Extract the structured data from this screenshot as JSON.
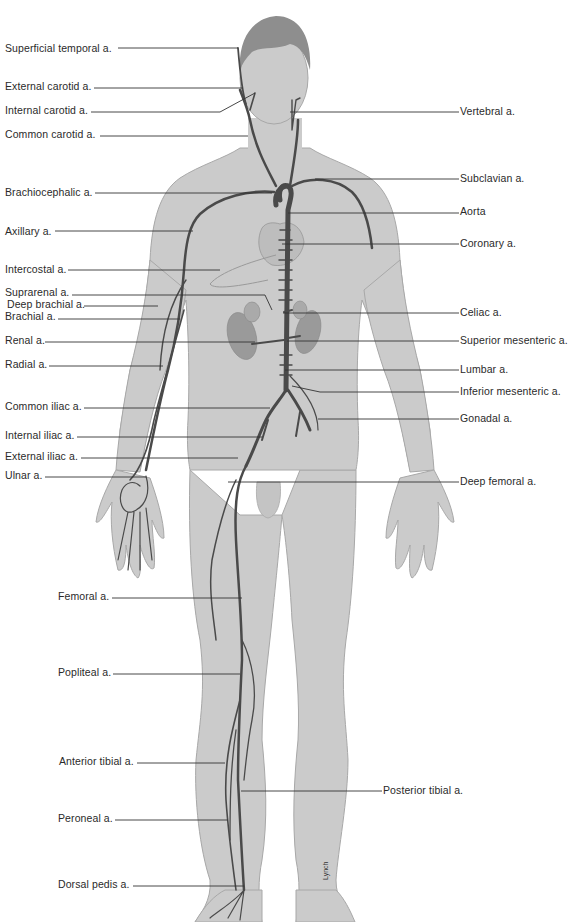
{
  "diagram": {
    "type": "anatomical-illustration",
    "colors": {
      "background": "#ffffff",
      "body_fill": "#cbcbcb",
      "body_outline": "#a8a8a8",
      "hair": "#8e8e8e",
      "artery": "#4a4a4a",
      "organ": "#9a9a9a",
      "label_text": "#2a2a2a",
      "leader_line": "#333333"
    },
    "signature": "Lynch",
    "labels_left": [
      {
        "id": "superficial-temporal",
        "text": "Superficial temporal a.",
        "x": 5,
        "y": 42,
        "line": [
          118,
          48,
          238,
          48
        ]
      },
      {
        "id": "external-carotid",
        "text": "External carotid a.",
        "x": 5,
        "y": 80,
        "line": [
          94,
          88,
          243,
          88
        ]
      },
      {
        "id": "internal-carotid",
        "text": "Internal carotid a.",
        "x": 5,
        "y": 104,
        "line": [
          91,
          112,
          220,
          112,
          255,
          93
        ]
      },
      {
        "id": "common-carotid",
        "text": "Common carotid a.",
        "x": 5,
        "y": 128,
        "line": [
          100,
          136,
          248,
          136
        ]
      },
      {
        "id": "brachiocephalic",
        "text": "Brachiocephalic a.",
        "x": 5,
        "y": 186,
        "line": [
          95,
          193,
          272,
          193
        ]
      },
      {
        "id": "axillary",
        "text": "Axillary a.",
        "x": 5,
        "y": 225,
        "line": [
          55,
          231,
          193,
          231
        ]
      },
      {
        "id": "intercostal",
        "text": "Intercostal a.",
        "x": 5,
        "y": 263,
        "line": [
          68,
          270,
          220,
          270
        ]
      },
      {
        "id": "suprarenal",
        "text": "Suprarenal a.",
        "x": 5,
        "y": 286,
        "line": [
          72,
          295,
          265,
          295,
          272,
          310
        ]
      },
      {
        "id": "deep-brachial",
        "text": "Deep brachial a.",
        "x": 7,
        "y": 298,
        "line": [
          84,
          306,
          158,
          306
        ]
      },
      {
        "id": "brachial",
        "text": "Brachial a.",
        "x": 5,
        "y": 310,
        "line": [
          58,
          319,
          180,
          319
        ]
      },
      {
        "id": "renal",
        "text": "Renal a.",
        "x": 5,
        "y": 334,
        "line": [
          45,
          342,
          255,
          342
        ]
      },
      {
        "id": "radial",
        "text": "Radial a.",
        "x": 5,
        "y": 358,
        "line": [
          49,
          366,
          163,
          366
        ]
      },
      {
        "id": "common-iliac",
        "text": "Common iliac a.",
        "x": 5,
        "y": 398,
        "line": [
          84,
          408,
          270,
          408
        ]
      },
      {
        "id": "internal-iliac",
        "text": "Internal iliac a.",
        "x": 5,
        "y": 427,
        "line": [
          77,
          437,
          262,
          437
        ]
      },
      {
        "id": "external-iliac",
        "text": "External iliac a.",
        "x": 5,
        "y": 448,
        "line": [
          81,
          458,
          238,
          458
        ]
      },
      {
        "id": "ulnar",
        "text": "Ulnar a.",
        "x": 5,
        "y": 469,
        "line": [
          45,
          477,
          146,
          477
        ]
      },
      {
        "id": "femoral",
        "text": "Femoral a.",
        "x": 58,
        "y": 589,
        "line": [
          112,
          598,
          242,
          598
        ]
      },
      {
        "id": "popliteal",
        "text": "Popliteal a.",
        "x": 58,
        "y": 665,
        "line": [
          113,
          674,
          240,
          674
        ]
      },
      {
        "id": "anterior-tibial",
        "text": "Anterior tibial a.",
        "x": 59,
        "y": 754,
        "line": [
          137,
          763,
          225,
          763
        ]
      },
      {
        "id": "peroneal",
        "text": "Peroneal a.",
        "x": 58,
        "y": 811,
        "line": [
          115,
          820,
          228,
          820
        ]
      },
      {
        "id": "dorsal-pedis",
        "text": "Dorsal pedis a.",
        "x": 58,
        "y": 878,
        "line": [
          133,
          886,
          244,
          886
        ]
      }
    ],
    "labels_right": [
      {
        "id": "vertebral",
        "text": "Vertebral a.",
        "x": 460,
        "y": 104,
        "line": [
          290,
          112,
          459,
          112
        ]
      },
      {
        "id": "subclavian",
        "text": "Subclavian a.",
        "x": 460,
        "y": 171,
        "line": [
          315,
          179,
          459,
          179
        ]
      },
      {
        "id": "aorta",
        "text": "Aorta",
        "x": 460,
        "y": 204,
        "line": [
          288,
          213,
          459,
          213
        ]
      },
      {
        "id": "coronary",
        "text": "Coronary a.",
        "x": 460,
        "y": 236,
        "line": [
          282,
          244,
          459,
          244
        ]
      },
      {
        "id": "celiac",
        "text": "Celiac a.",
        "x": 460,
        "y": 305,
        "line": [
          283,
          313,
          459,
          313
        ]
      },
      {
        "id": "superior-mesenteric",
        "text": "Superior mesenteric a.",
        "x": 460,
        "y": 333,
        "line": [
          287,
          341,
          459,
          341
        ]
      },
      {
        "id": "lumbar",
        "text": "Lumbar a.",
        "x": 460,
        "y": 362,
        "line": [
          285,
          370,
          459,
          370
        ]
      },
      {
        "id": "inferior-mesenteric",
        "text": "Inferior mesenteric a.",
        "x": 460,
        "y": 384,
        "line": [
          292,
          386,
          320,
          392,
          459,
          392
        ]
      },
      {
        "id": "gonadal",
        "text": "Gonadal a.",
        "x": 460,
        "y": 410,
        "line": [
          318,
          419,
          459,
          419
        ]
      },
      {
        "id": "deep-femoral",
        "text": "Deep femoral a.",
        "x": 460,
        "y": 474,
        "line": [
          228,
          482,
          459,
          482
        ]
      },
      {
        "id": "posterior-tibial",
        "text": "Posterior tibial a.",
        "x": 383,
        "y": 782,
        "line": [
          241,
          791,
          382,
          791
        ]
      }
    ]
  }
}
